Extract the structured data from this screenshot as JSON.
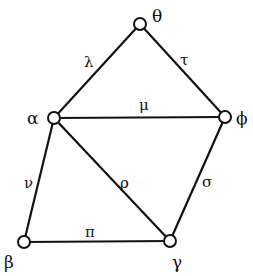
{
  "diagram": {
    "type": "graph",
    "nodes": [
      {
        "id": "theta",
        "label": "θ",
        "x": 140,
        "y": 24
      },
      {
        "id": "alpha",
        "label": "α",
        "x": 54,
        "y": 118
      },
      {
        "id": "phi",
        "label": "ϕ",
        "x": 225,
        "y": 117
      },
      {
        "id": "beta",
        "label": "β",
        "x": 24,
        "y": 242
      },
      {
        "id": "gamma",
        "label": "γ",
        "x": 170,
        "y": 241
      }
    ],
    "edges": [
      {
        "from": "alpha",
        "to": "theta",
        "label": "λ"
      },
      {
        "from": "theta",
        "to": "phi",
        "label": "τ"
      },
      {
        "from": "alpha",
        "to": "phi",
        "label": "μ"
      },
      {
        "from": "alpha",
        "to": "beta",
        "label": "ν"
      },
      {
        "from": "alpha",
        "to": "gamma",
        "label": "ρ"
      },
      {
        "from": "phi",
        "to": "gamma",
        "label": "σ"
      },
      {
        "from": "beta",
        "to": "gamma",
        "label": "π"
      }
    ]
  }
}
